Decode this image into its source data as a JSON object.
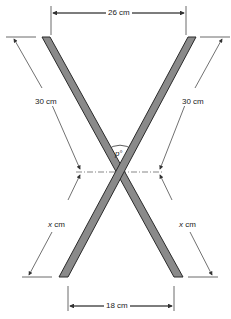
{
  "diagram": {
    "top_width": {
      "value": "26",
      "unit": "cm",
      "label": "26 cm"
    },
    "bottom_width": {
      "value": "18",
      "unit": "cm",
      "label": "18 cm"
    },
    "upper_left_length": {
      "label": "30 cm"
    },
    "upper_right_length": {
      "label": "30 cm"
    },
    "lower_left_length": {
      "var": "x",
      "unit": "cm"
    },
    "lower_right_length": {
      "var": "x",
      "unit": "cm"
    },
    "angle": {
      "var": "p",
      "symbol": "°"
    }
  },
  "colors": {
    "bar_fill": "#8a8a8a",
    "bar_stroke": "#2a2a2a",
    "line": "#333333"
  }
}
